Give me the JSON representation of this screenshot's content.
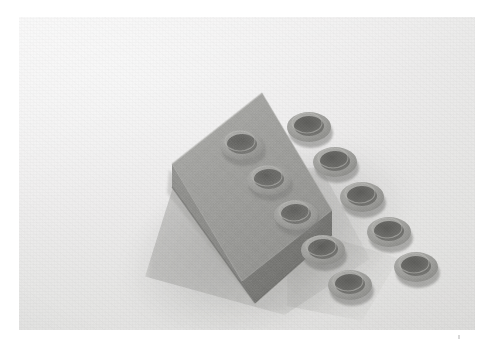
{
  "page": {
    "background_color": "#ffffff",
    "width": 491,
    "height": 347
  },
  "photo": {
    "kind": "photograph",
    "caption": "Gray toy construction brick with ten studs on a light gray surface",
    "frame": {
      "x": 19,
      "y": 17,
      "width": 456,
      "height": 313
    },
    "background_color": "#ededec",
    "surface_description": "plain light gray paper backdrop",
    "lighting": "diffuse light from upper left",
    "shadow": {
      "color": "#8a8a87",
      "direction": "lower-left and lower-right",
      "softness": "soft"
    }
  },
  "subject": {
    "name": "toy-building-brick",
    "label": "Toy building brick",
    "color_hex": "#9a9a97",
    "top_face_color": "#9e9e9b",
    "left_face_color": "#8a8a87",
    "right_face_color": "#767673",
    "stud_count": 10,
    "stud_rows": 5,
    "stud_columns": 2,
    "stud_type": "hollow ring stud",
    "material": "matte molded plastic",
    "orientation": "angled, long axis running upper-right to lower-left",
    "studs": [
      {
        "id": "stud-r1-c1",
        "row": 1,
        "col": 1,
        "cx": 223,
        "cy": 128,
        "rx": 21,
        "ry": 14
      },
      {
        "id": "stud-r1-c2",
        "row": 1,
        "col": 2,
        "cx": 290,
        "cy": 110,
        "rx": 21,
        "ry": 14
      },
      {
        "id": "stud-r2-c1",
        "row": 2,
        "col": 1,
        "cx": 250,
        "cy": 163,
        "rx": 21,
        "ry": 14
      },
      {
        "id": "stud-r2-c2",
        "row": 2,
        "col": 2,
        "cx": 316,
        "cy": 145,
        "rx": 21,
        "ry": 14
      },
      {
        "id": "stud-r3-c1",
        "row": 3,
        "col": 1,
        "cx": 277,
        "cy": 198,
        "rx": 21,
        "ry": 14
      },
      {
        "id": "stud-r3-c2",
        "row": 3,
        "col": 2,
        "cx": 343,
        "cy": 180,
        "rx": 21,
        "ry": 14
      },
      {
        "id": "stud-r4-c1",
        "row": 4,
        "col": 1,
        "cx": 304,
        "cy": 233,
        "rx": 21,
        "ry": 14
      },
      {
        "id": "stud-r4-c2",
        "row": 4,
        "col": 2,
        "cx": 370,
        "cy": 215,
        "rx": 21,
        "ry": 14
      },
      {
        "id": "stud-r5-c1",
        "row": 5,
        "col": 1,
        "cx": 331,
        "cy": 268,
        "rx": 21,
        "ry": 14
      },
      {
        "id": "stud-r5-c2",
        "row": 5,
        "col": 2,
        "cx": 397,
        "cy": 250,
        "rx": 21,
        "ry": 14
      }
    ],
    "geometry": {
      "top_face_polygon": "153,147 243,76 313,193 223,264",
      "left_face_polygon": "153,147 223,264 236,286 153,170",
      "right_face_polygon": "223,264 313,193 313,218 236,286"
    }
  },
  "marks": [
    {
      "name": "corner-speck",
      "x": 458,
      "y": 335,
      "color": "#cfcfcf"
    }
  ]
}
